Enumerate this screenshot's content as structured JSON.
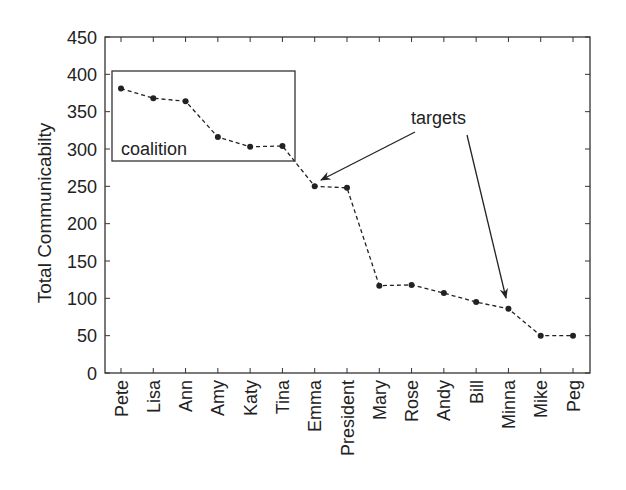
{
  "chart_data": {
    "type": "line",
    "title": "",
    "xlabel": "",
    "ylabel": "Total Communicabilty",
    "ylim": [
      0,
      450
    ],
    "yticks": [
      0,
      50,
      100,
      150,
      200,
      250,
      300,
      350,
      400,
      450
    ],
    "grid": false,
    "legend": null,
    "categories": [
      "Pete",
      "Lisa",
      "Ann",
      "Amy",
      "Katy",
      "Tina",
      "Emma",
      "President",
      "Mary",
      "Rose",
      "Andy",
      "Bill",
      "Minna",
      "Mike",
      "Peg"
    ],
    "series": [
      {
        "name": "Total Communicability",
        "style": "dashed line with dot markers",
        "values": [
          381,
          368,
          364,
          316,
          303,
          304,
          250,
          248,
          117,
          118,
          107,
          95,
          86,
          50,
          50
        ]
      }
    ],
    "annotations": [
      {
        "type": "box",
        "label": "coalition",
        "covers": [
          "Pete",
          "Lisa",
          "Ann",
          "Amy",
          "Katy",
          "Tina"
        ]
      },
      {
        "type": "arrows",
        "label": "targets",
        "points_to": [
          "Emma",
          "Minna"
        ]
      }
    ]
  },
  "colors": {
    "line": "#222222",
    "axis": "#333333",
    "background": "#ffffff"
  }
}
